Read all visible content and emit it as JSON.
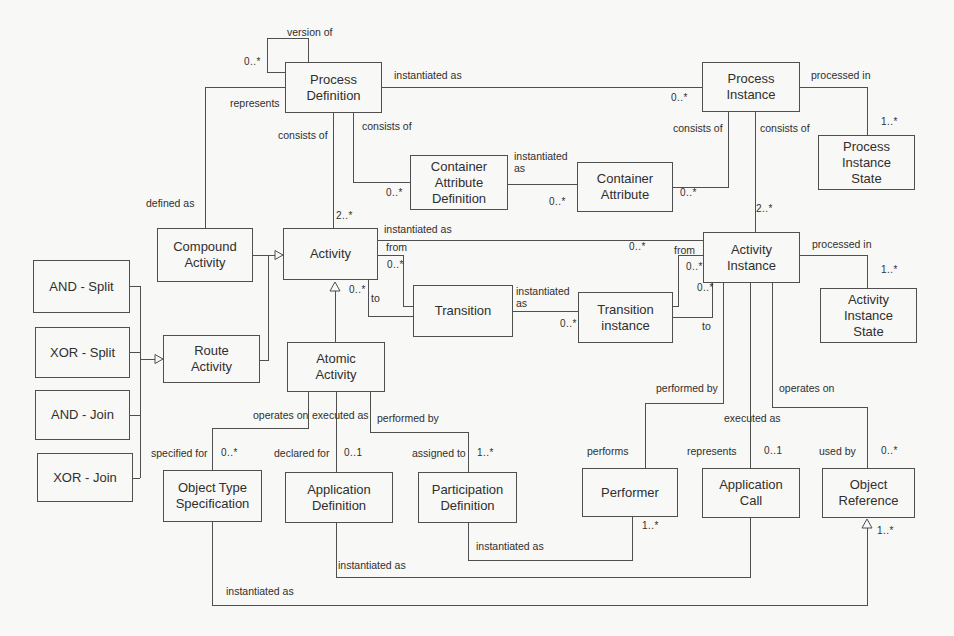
{
  "diagram": {
    "boxes": {
      "process_definition": "Process\nDefinition",
      "process_instance": "Process\nInstance",
      "process_instance_state": "Process\nInstance\nState",
      "container_attribute_definition": "Container\nAttribute\nDefinition",
      "container_attribute": "Container\nAttribute",
      "compound_activity": "Compound\nActivity",
      "activity": "Activity",
      "activity_instance": "Activity\nInstance",
      "activity_instance_state": "Activity\nInstance\nState",
      "transition": "Transition",
      "transition_instance": "Transition\ninstance",
      "and_split": "AND - Split",
      "xor_split": "XOR - Split",
      "and_join": "AND - Join",
      "xor_join": "XOR - Join",
      "route_activity": "Route\nActivity",
      "atomic_activity": "Atomic\nActivity",
      "object_type_specification": "Object Type\nSpecification",
      "application_definition": "Application\nDefinition",
      "participation_definition": "Participation\nDefinition",
      "performer": "Performer",
      "application_call": "Application\nCall",
      "object_reference": "Object\nReference"
    },
    "labels": {
      "version_of": "version of",
      "represents": "represents",
      "defined_as": "defined as",
      "instantiated_as": "instantiated as",
      "instantiated_as_wrapped": "instantiated\nas",
      "consists_of": "consists of",
      "processed_in": "processed in",
      "from": "from",
      "to": "to",
      "operates_on": "operates on",
      "executed_as": "executed as",
      "performed_by": "performed by",
      "specified_for": "specified for",
      "declared_for": "declared for",
      "assigned_to": "assigned to",
      "performs": "performs",
      "used_by": "used by"
    },
    "multiplicities": {
      "zero_many": "0..*",
      "one_many": "1..*",
      "zero_one": "0..1",
      "two_many": "2..*"
    },
    "relationships": [
      {
        "from": "Process Definition",
        "to": "Process Definition",
        "label": "version of",
        "multiplicity": "0..*"
      },
      {
        "from": "Process Definition",
        "to": "Process Instance",
        "label": "instantiated as",
        "multiplicity": "0..*"
      },
      {
        "from": "Process Definition",
        "to": "Compound Activity",
        "label": "represents / defined as"
      },
      {
        "from": "Process Definition",
        "to": "Activity",
        "label": "consists of",
        "multiplicity": "2..*"
      },
      {
        "from": "Process Definition",
        "to": "Container Attribute Definition",
        "label": "consists of",
        "multiplicity": "0..*"
      },
      {
        "from": "Container Attribute Definition",
        "to": "Container Attribute",
        "label": "instantiated as",
        "multiplicity": "0..*"
      },
      {
        "from": "Process Instance",
        "to": "Container Attribute",
        "label": "consists of",
        "multiplicity": "0..*"
      },
      {
        "from": "Process Instance",
        "to": "Activity Instance",
        "label": "consists of",
        "multiplicity": "2..*"
      },
      {
        "from": "Process Instance",
        "to": "Process Instance State",
        "label": "processed in",
        "multiplicity": "1..*"
      },
      {
        "from": "Activity",
        "to": "Activity Instance",
        "label": "instantiated as",
        "multiplicity": "0..*"
      },
      {
        "from": "Activity",
        "to": "Transition",
        "label": "from",
        "multiplicity": "0..*"
      },
      {
        "from": "Activity",
        "to": "Transition",
        "label": "to",
        "multiplicity": "0..*"
      },
      {
        "from": "Transition",
        "to": "Transition instance",
        "label": "instantiated as",
        "multiplicity": "0..*"
      },
      {
        "from": "Activity Instance",
        "to": "Transition instance",
        "label": "from",
        "multiplicity": "0..*"
      },
      {
        "from": "Activity Instance",
        "to": "Transition instance",
        "label": "to",
        "multiplicity": "0..*"
      },
      {
        "from": "Activity Instance",
        "to": "Activity Instance State",
        "label": "processed in",
        "multiplicity": "1..*"
      },
      {
        "from": "Activity Instance",
        "to": "Performer",
        "label": "performed by / performs"
      },
      {
        "from": "Activity Instance",
        "to": "Application Call",
        "label": "executed as / represents",
        "multiplicity": "0..1"
      },
      {
        "from": "Activity Instance",
        "to": "Object Reference",
        "label": "operates on / used by",
        "multiplicity": "0..*"
      },
      {
        "from": "Compound Activity",
        "to": "Activity",
        "label": "generalization"
      },
      {
        "from": "Route Activity",
        "to": "Activity",
        "label": "generalization"
      },
      {
        "from": "Atomic Activity",
        "to": "Activity",
        "label": "generalization"
      },
      {
        "from": "AND - Split",
        "to": "Route Activity",
        "label": "generalization"
      },
      {
        "from": "XOR - Split",
        "to": "Route Activity",
        "label": "generalization"
      },
      {
        "from": "AND - Join",
        "to": "Route Activity",
        "label": "generalization"
      },
      {
        "from": "XOR - Join",
        "to": "Route Activity",
        "label": "generalization"
      },
      {
        "from": "Atomic Activity",
        "to": "Object Type Specification",
        "label": "operates on / specified for",
        "multiplicity": "0..*"
      },
      {
        "from": "Atomic Activity",
        "to": "Application Definition",
        "label": "executed as / declared for",
        "multiplicity": "0..1"
      },
      {
        "from": "Atomic Activity",
        "to": "Participation Definition",
        "label": "performed by / assigned to",
        "multiplicity": "1..*"
      },
      {
        "from": "Participation Definition",
        "to": "Performer",
        "label": "instantiated as",
        "multiplicity": "1..*"
      },
      {
        "from": "Application Definition",
        "to": "Application Call",
        "label": "instantiated as"
      },
      {
        "from": "Object Type Specification",
        "to": "Object Reference",
        "label": "instantiated as",
        "multiplicity": "1..*"
      }
    ]
  }
}
